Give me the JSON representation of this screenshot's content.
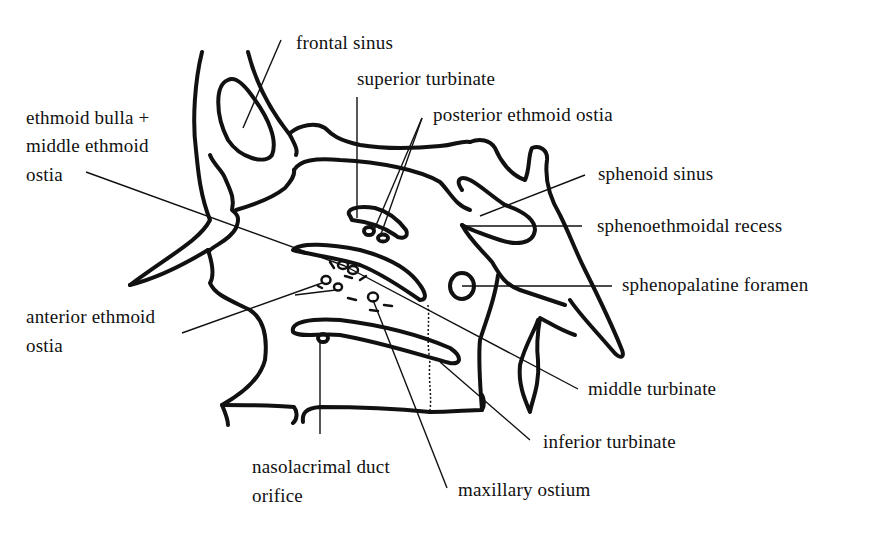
{
  "figure": {
    "labels": {
      "frontal_sinus": "frontal sinus",
      "superior_turbinate": "superior turbinate",
      "posterior_ethmoid_ostia": "posterior ethmoid ostia",
      "ethmoid_bulla_line1": "ethmoid bulla +",
      "ethmoid_bulla_line2": "middle ethmoid",
      "ethmoid_bulla_line3": "ostia",
      "sphenoid_sinus": "sphenoid sinus",
      "sphenoethmoidal_recess": "sphenoethmoidal recess",
      "sphenopalatine_foramen": "sphenopalatine foramen",
      "anterior_ethmoid_line1": "anterior ethmoid",
      "anterior_ethmoid_line2": "ostia",
      "middle_turbinate": "middle turbinate",
      "inferior_turbinate": "inferior turbinate",
      "nasolacrimal_line1": "nasolacrimal duct",
      "nasolacrimal_line2": "orifice",
      "maxillary_ostium": "maxillary ostium"
    },
    "colors": {
      "ink": "#111111",
      "background": "#ffffff"
    }
  }
}
